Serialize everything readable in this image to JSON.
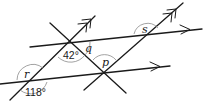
{
  "diagram": {
    "type": "geometry-angles-parallel-lines",
    "lines": {
      "upper_parallel": {
        "arrow": "single"
      },
      "lower_parallel": {
        "arrow": "single"
      },
      "transversal_left": {
        "arrow": "double"
      },
      "transversal_right": {
        "arrow": "double"
      },
      "transversal_cross": {
        "arrow": "none"
      }
    },
    "angles": {
      "a42": "42°",
      "a118": "118°",
      "q": "q",
      "p": "p",
      "r": "r",
      "s": "s"
    },
    "colors": {
      "line": "#1a1a1a",
      "arc": "#8a8a8a",
      "background": "#ffffff"
    }
  }
}
